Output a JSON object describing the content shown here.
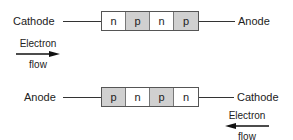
{
  "top_diode": {
    "left_terminal": "Cathode",
    "right_terminal": "Anode",
    "layers": [
      {
        "type": "n",
        "label": "n"
      },
      {
        "type": "p",
        "label": "p"
      },
      {
        "type": "n",
        "label": "n"
      },
      {
        "type": "p",
        "label": "p"
      }
    ],
    "electron_flow": {
      "line1": "Electron",
      "line2": "flow",
      "direction": "right"
    }
  },
  "bottom_diode": {
    "left_terminal": "Anode",
    "right_terminal": "Cathode",
    "layers": [
      {
        "type": "p",
        "label": "p"
      },
      {
        "type": "n",
        "label": "n"
      },
      {
        "type": "p",
        "label": "p"
      },
      {
        "type": "n",
        "label": "n"
      }
    ],
    "electron_flow": {
      "line1": "Electron",
      "line2": "flow",
      "direction": "left"
    }
  },
  "colors": {
    "n_layer": "#ffffff",
    "p_layer": "#d0d0d0",
    "line": "#333333"
  }
}
